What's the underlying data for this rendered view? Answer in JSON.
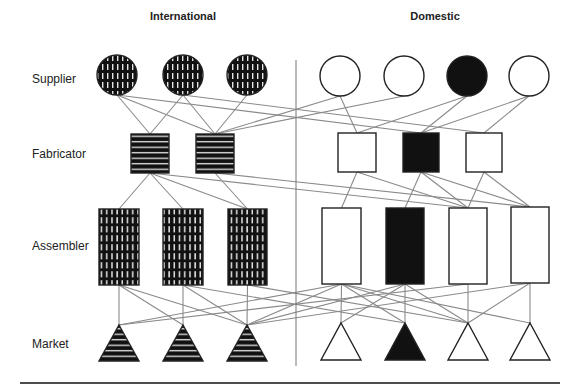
{
  "headers": {
    "international": "International",
    "domestic": "Domestic"
  },
  "rows": {
    "supplier": "Supplier",
    "fabricator": "Fabricator",
    "assembler": "Assembler",
    "market": "Market"
  },
  "colors": {
    "line": "#8a8a8a",
    "stroke": "#222222",
    "dark_fill": "#111111",
    "pattern_light": "#e6e6e6",
    "white_fill": "#ffffff"
  },
  "nodes": {
    "suppliers": [
      {
        "id": "S1",
        "group": "international",
        "fill": "vstripe",
        "cx": 117,
        "cy": 75
      },
      {
        "id": "S2",
        "group": "international",
        "fill": "vstripe",
        "cx": 183,
        "cy": 75
      },
      {
        "id": "S3",
        "group": "international",
        "fill": "vstripe",
        "cx": 247,
        "cy": 75
      },
      {
        "id": "DS1",
        "group": "domestic",
        "fill": "white",
        "cx": 340,
        "cy": 76
      },
      {
        "id": "DS2",
        "group": "domestic",
        "fill": "white",
        "cx": 404,
        "cy": 76
      },
      {
        "id": "DS3",
        "group": "domestic",
        "fill": "black",
        "cx": 467,
        "cy": 76
      },
      {
        "id": "DS4",
        "group": "domestic",
        "fill": "white",
        "cx": 529,
        "cy": 76
      }
    ],
    "fabricators": [
      {
        "id": "F1",
        "group": "international",
        "fill": "hstripe",
        "x": 131,
        "y": 134,
        "w": 38,
        "h": 39
      },
      {
        "id": "F2",
        "group": "international",
        "fill": "hstripe",
        "x": 196,
        "y": 134,
        "w": 38,
        "h": 39
      },
      {
        "id": "DF1",
        "group": "domestic",
        "fill": "white",
        "x": 338,
        "y": 133,
        "w": 38,
        "h": 39
      },
      {
        "id": "DF2",
        "group": "domestic",
        "fill": "black",
        "x": 403,
        "y": 133,
        "w": 36,
        "h": 39
      },
      {
        "id": "DF3",
        "group": "domestic",
        "fill": "white",
        "x": 466,
        "y": 133,
        "w": 36,
        "h": 39
      }
    ],
    "assemblers": [
      {
        "id": "A1",
        "group": "international",
        "fill": "grid",
        "x": 99,
        "y": 209,
        "w": 40,
        "h": 76
      },
      {
        "id": "A2",
        "group": "international",
        "fill": "grid",
        "x": 163,
        "y": 209,
        "w": 40,
        "h": 76
      },
      {
        "id": "A3",
        "group": "international",
        "fill": "grid",
        "x": 228,
        "y": 209,
        "w": 39,
        "h": 76
      },
      {
        "id": "DA1",
        "group": "domestic",
        "fill": "white",
        "x": 322,
        "y": 208,
        "w": 39,
        "h": 76
      },
      {
        "id": "DA2",
        "group": "domestic",
        "fill": "black",
        "x": 386,
        "y": 208,
        "w": 38,
        "h": 76
      },
      {
        "id": "DA3",
        "group": "domestic",
        "fill": "white",
        "x": 449,
        "y": 208,
        "w": 38,
        "h": 76
      },
      {
        "id": "DA4",
        "group": "domestic",
        "fill": "white",
        "x": 511,
        "y": 207,
        "w": 38,
        "h": 76
      }
    ],
    "markets": [
      {
        "id": "M1",
        "group": "international",
        "fill": "hstripe",
        "cx": 119,
        "top": 325,
        "base": 361,
        "half": 20
      },
      {
        "id": "M2",
        "group": "international",
        "fill": "hstripe",
        "cx": 183,
        "top": 325,
        "base": 361,
        "half": 20
      },
      {
        "id": "M3",
        "group": "international",
        "fill": "hstripe",
        "cx": 247,
        "top": 325,
        "base": 361,
        "half": 20
      },
      {
        "id": "DM1",
        "group": "domestic",
        "fill": "white",
        "cx": 341,
        "top": 323,
        "base": 360,
        "half": 20
      },
      {
        "id": "DM2",
        "group": "domestic",
        "fill": "black",
        "cx": 405,
        "top": 323,
        "base": 360,
        "half": 20
      },
      {
        "id": "DM3",
        "group": "domestic",
        "fill": "white",
        "cx": 468,
        "top": 323,
        "base": 360,
        "half": 20
      },
      {
        "id": "DM4",
        "group": "domestic",
        "fill": "white",
        "cx": 530,
        "top": 323,
        "base": 360,
        "half": 20
      }
    ]
  },
  "edges": [
    [
      "S1",
      "F1"
    ],
    [
      "S1",
      "F2"
    ],
    [
      "S1",
      "DF2"
    ],
    [
      "S2",
      "F1"
    ],
    [
      "S2",
      "F2"
    ],
    [
      "S2",
      "DF3"
    ],
    [
      "S3",
      "F2"
    ],
    [
      "DS1",
      "F2"
    ],
    [
      "DS1",
      "DF1"
    ],
    [
      "DS2",
      "F2"
    ],
    [
      "DS3",
      "DF1"
    ],
    [
      "DS3",
      "DF2"
    ],
    [
      "DS4",
      "DF2"
    ],
    [
      "DS4",
      "DF3"
    ],
    [
      "F1",
      "A1"
    ],
    [
      "F1",
      "A2"
    ],
    [
      "F1",
      "A3"
    ],
    [
      "F1",
      "DA3"
    ],
    [
      "F2",
      "A3"
    ],
    [
      "F2",
      "DA4"
    ],
    [
      "DF1",
      "DA1"
    ],
    [
      "DF1",
      "DA3"
    ],
    [
      "DF2",
      "DA2"
    ],
    [
      "DF2",
      "DA3"
    ],
    [
      "DF2",
      "DA4"
    ],
    [
      "DF3",
      "DA3"
    ],
    [
      "DF3",
      "DA4"
    ],
    [
      "A1",
      "M1"
    ],
    [
      "A1",
      "M2"
    ],
    [
      "A1",
      "M3"
    ],
    [
      "A2",
      "M2"
    ],
    [
      "A2",
      "M3"
    ],
    [
      "A2",
      "DM2"
    ],
    [
      "A3",
      "M3"
    ],
    [
      "A3",
      "DM3"
    ],
    [
      "DA1",
      "M1"
    ],
    [
      "DA1",
      "M3"
    ],
    [
      "DA1",
      "DM1"
    ],
    [
      "DA1",
      "DM2"
    ],
    [
      "DA1",
      "DM3"
    ],
    [
      "DA1",
      "DM4"
    ],
    [
      "DA2",
      "M3"
    ],
    [
      "DA2",
      "DM1"
    ],
    [
      "DA2",
      "DM2"
    ],
    [
      "DA2",
      "DM3"
    ],
    [
      "DA3",
      "M1"
    ],
    [
      "DA3",
      "DM3"
    ],
    [
      "DA4",
      "M3"
    ],
    [
      "DA4",
      "DM3"
    ],
    [
      "DA4",
      "DM4"
    ]
  ],
  "layout": {
    "supplier_radius": 20,
    "divider": {
      "x": 296,
      "y1": 60,
      "y2": 366
    },
    "rule": {
      "x1": 20,
      "x2": 560,
      "y": 383
    },
    "header_x": {
      "international": 183,
      "domestic": 435
    },
    "row_y": {
      "supplier": 79,
      "fabricator": 154,
      "assembler": 246,
      "market": 344
    }
  }
}
